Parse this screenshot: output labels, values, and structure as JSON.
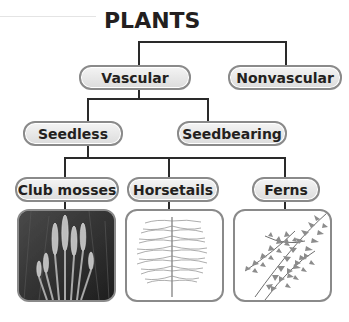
{
  "title": "PLANTS",
  "nodes": {
    "vascular": "Vascular",
    "nonvascular": "Nonvascular",
    "seedless": "Seedless",
    "seedbearing": "Seedbearing",
    "club_mosses": "Club mosses",
    "horsetails": "Horsetails",
    "ferns": "Ferns"
  },
  "images": [
    {
      "name": "club-mosses-photo",
      "depicts": "club mosses"
    },
    {
      "name": "horsetails-illustration",
      "depicts": "horsetail"
    },
    {
      "name": "ferns-illustration",
      "depicts": "fern fronds"
    }
  ],
  "colors": {
    "line": "#2a2a2a",
    "node_border": "#8a8a8a",
    "node_fill": "#e6e6e6"
  }
}
